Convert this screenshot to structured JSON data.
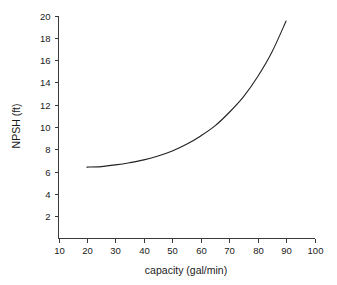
{
  "chart_data": {
    "type": "line",
    "title": "",
    "xlabel": "capacity (gal/min)",
    "ylabel": "NPSH (ft)",
    "xlim": [
      10,
      100
    ],
    "ylim": [
      0,
      20
    ],
    "grid": false,
    "legend": false,
    "x_ticks": [
      10,
      20,
      30,
      40,
      50,
      60,
      70,
      80,
      90,
      100
    ],
    "x_tick_labels": [
      "10",
      "20",
      "30",
      "40",
      "50",
      "60",
      "70",
      "80",
      "90",
      "100"
    ],
    "y_ticks": [
      2,
      4,
      6,
      8,
      10,
      12,
      14,
      16,
      18,
      20
    ],
    "y_tick_labels": [
      "2",
      "4",
      "6",
      "8",
      "10",
      "12",
      "14",
      "16",
      "18",
      "20"
    ],
    "series": [
      {
        "name": "NPSH required",
        "x": [
          20,
          25,
          30,
          35,
          40,
          45,
          50,
          55,
          60,
          65,
          70,
          75,
          80,
          85,
          90
        ],
        "values": [
          6.4,
          6.45,
          6.6,
          6.8,
          7.05,
          7.4,
          7.85,
          8.45,
          9.2,
          10.1,
          11.3,
          12.7,
          14.5,
          16.7,
          19.5
        ]
      }
    ],
    "curve_color": "#222222",
    "axis_color": "#3a3a3a",
    "background_color": "#ffffff"
  },
  "axis_labels": {
    "x_title": "capacity (gal/min)",
    "y_title": "NPSH (ft)"
  }
}
